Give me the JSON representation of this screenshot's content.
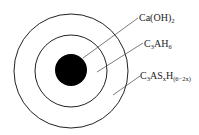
{
  "diagram": {
    "type": "concentric-layers",
    "layers": [
      {
        "id": "core",
        "fill": "#000000"
      },
      {
        "id": "middle-ring",
        "label": "C3AH6"
      },
      {
        "id": "outer-ring",
        "label": "C3ASxH(6-2x)"
      }
    ],
    "labels": [
      {
        "base1": "Ca(OH)",
        "sub1": "2",
        "target": "core"
      },
      {
        "base1": "C",
        "sub1": "3",
        "base2": "AH",
        "sub2": "6",
        "target": "middle-ring"
      },
      {
        "base1": "C",
        "sub1": "3",
        "base2": "AS",
        "sub2": "x",
        "base3": "H",
        "sub3": "(6−2x)",
        "target": "outer-ring"
      }
    ],
    "colors": {
      "stroke": "#222222",
      "core": "#000000",
      "background": "#ffffff"
    }
  }
}
